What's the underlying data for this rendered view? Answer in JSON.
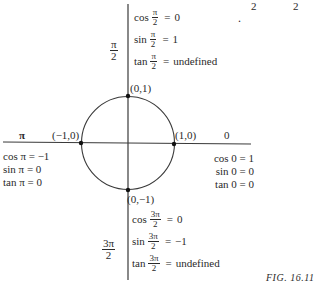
{
  "top_fragment": {
    "left": "2",
    "right": "2",
    "dot": "."
  },
  "quadrant_top": {
    "angle": {
      "num": "π",
      "den": "2"
    },
    "rows": [
      {
        "fn": "cos",
        "num": "π",
        "den": "2",
        "op": "=",
        "value": "0"
      },
      {
        "fn": "sin",
        "num": "π",
        "den": "2",
        "op": "=",
        "value": "1"
      },
      {
        "fn": "tan",
        "num": "π",
        "den": "2",
        "op": "=",
        "value": "undefined"
      }
    ]
  },
  "points": {
    "top": "(0,1)",
    "left": "(−1,0)",
    "right": "(1,0)",
    "bottom": "(0,−1)"
  },
  "axis_labels": {
    "left": "π",
    "right": "0"
  },
  "quadrant_left": {
    "rows": [
      {
        "text": "cos π = −1"
      },
      {
        "text": "sin π = 0"
      },
      {
        "text": "tan π = 0"
      }
    ]
  },
  "quadrant_right": {
    "rows": [
      {
        "text": "cos 0 = 1"
      },
      {
        "text": "sin 0 = 0"
      },
      {
        "text": "tan 0 = 0"
      }
    ]
  },
  "quadrant_bottom": {
    "angle": {
      "num": "3π",
      "den": "2"
    },
    "rows": [
      {
        "fn": "cos",
        "num": "3π",
        "den": "2",
        "op": "=",
        "value": "0"
      },
      {
        "fn": "sin",
        "num": "3π",
        "den": "2",
        "op": "=",
        "value": "−1"
      },
      {
        "fn": "tan",
        "num": "3π",
        "den": "2",
        "op": "=",
        "value": "undefined"
      }
    ]
  },
  "caption": "FIG. 16.11",
  "colors": {
    "ink": "#2a2a2a",
    "background": "#ffffff"
  }
}
